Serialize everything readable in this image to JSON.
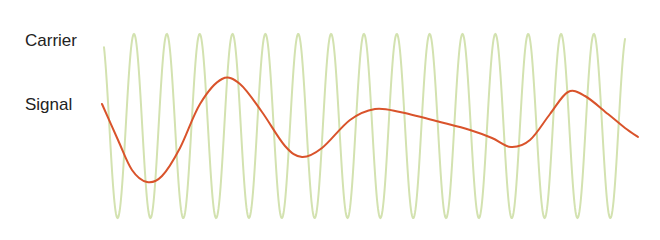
{
  "diagram": {
    "type": "modulation-waveforms",
    "labels": {
      "carrier": "Carrier",
      "signal": "Signal"
    },
    "colors": {
      "carrier": "#d3e2b0",
      "signal": "#d9532b",
      "text": "#222222",
      "background": "#ffffff"
    },
    "carrier": {
      "x_start": 104,
      "x_end": 625,
      "center_y": 126,
      "amplitude": 92,
      "period_px": 32.85,
      "first_peak_x": 134,
      "stroke_width": 2
    },
    "signal": {
      "stroke_width": 2,
      "points": [
        [
          102,
          104
        ],
        [
          118,
          140
        ],
        [
          132,
          170
        ],
        [
          147,
          182
        ],
        [
          162,
          176
        ],
        [
          180,
          148
        ],
        [
          200,
          104
        ],
        [
          222,
          79
        ],
        [
          240,
          84
        ],
        [
          262,
          112
        ],
        [
          285,
          146
        ],
        [
          302,
          157
        ],
        [
          322,
          148
        ],
        [
          350,
          120
        ],
        [
          375,
          109
        ],
        [
          400,
          112
        ],
        [
          440,
          122
        ],
        [
          470,
          130
        ],
        [
          492,
          138
        ],
        [
          511,
          147
        ],
        [
          530,
          140
        ],
        [
          550,
          114
        ],
        [
          568,
          92
        ],
        [
          585,
          96
        ],
        [
          608,
          114
        ],
        [
          625,
          128
        ],
        [
          638,
          137
        ]
      ]
    }
  }
}
